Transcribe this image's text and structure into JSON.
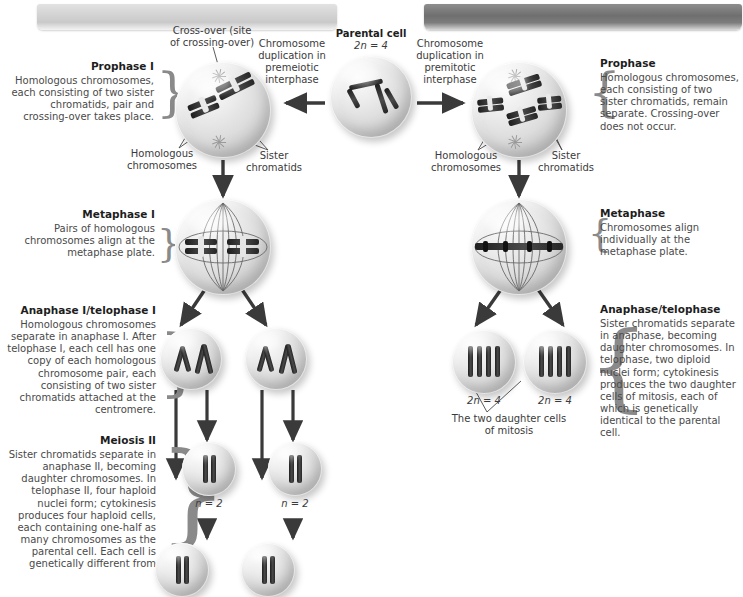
{
  "figure": {
    "title_left_banner": "",
    "title_right_banner": ""
  },
  "meiosis": {
    "stages": [
      {
        "id": "prophase-1",
        "heading": "Prophase I",
        "body": "Homologous chromosomes, each consisting of two sister chromatids, pair and crossing-over takes place."
      },
      {
        "id": "metaphase-1",
        "heading": "Metaphase I",
        "body": "Pairs of homologous chromosomes align at the metaphase plate."
      },
      {
        "id": "anaphase-telophase-1",
        "heading": "Anaphase I/telophase I",
        "body": "Homologous chromosomes separate in anaphase I. After telophase I, each cell has one copy of each homologous chromosome pair, each consisting of two sister chromatids attached at the centromere."
      },
      {
        "id": "meiosis-2",
        "heading": "Meiosis II",
        "body": "Sister chromatids separate in anaphase II, becoming daughter chromosomes. In telophase II, four haploid nuclei form; cytokinesis produces four haploid cells, each containing one-half as many chromosomes as the parental cell. Each cell is genetically different from"
      }
    ],
    "callouts": {
      "crossover": "Cross-over (site of crossing-over)",
      "homologous": "Homologous chromosomes",
      "sister": "Sister chromatids",
      "duplication": "Chromosome duplication in premeiotic interphase"
    },
    "ploidy_labels": [
      "n = 2",
      "n = 2"
    ]
  },
  "mitosis": {
    "stages": [
      {
        "id": "prophase",
        "heading": "Prophase",
        "body": "Homologous chromosomes, each consisting of two sister chromatids, remain separate. Crossing-over does not occur."
      },
      {
        "id": "metaphase",
        "heading": "Metaphase",
        "body": "Chromosomes align individually at the metaphase plate."
      },
      {
        "id": "anaphase-telophase",
        "heading": "Anaphase/telophase",
        "body": "Sister chromatids separate in anaphase, becoming daughter chromosomes. In telophase, two diploid nuclei form; cytokinesis produces the two daughter cells of mitosis, each of which is genetically identical to the parental cell."
      }
    ],
    "callouts": {
      "homologous": "Homologous chromosomes",
      "sister": "Sister chromatids",
      "duplication": "Chromosome duplication in premitotic interphase",
      "daughter_cells": "The two daughter cells of mitosis"
    },
    "ploidy_labels": [
      "2n = 4",
      "2n = 4"
    ]
  },
  "parental": {
    "label": "Parental cell",
    "ploidy": "2n = 4"
  },
  "colors": {
    "text": "#3b3b3b",
    "heading": "#1d1d1d",
    "chromosome": "#2b2b2b",
    "arrow": "#3a3a3a",
    "banner_left": "#d2d2d2",
    "banner_right": "#6f6f6f"
  }
}
